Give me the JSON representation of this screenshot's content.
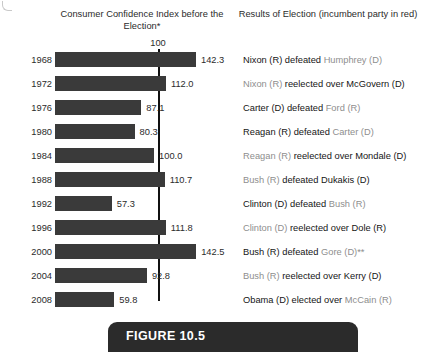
{
  "headers": {
    "left": "Consumer Confidence Index before the Election*",
    "right": "Results of Election (incumbent party in red)"
  },
  "axis": {
    "reference_label": "100"
  },
  "caption": {
    "label": "FIGURE 10.5"
  },
  "colors": {
    "bar": "#3a3a3a",
    "reference_line": "#111111",
    "incumbent_text": "#8e8e8e",
    "standard_text": "#151515",
    "banner": "#2b2b2b"
  },
  "chart_data": {
    "type": "bar",
    "title": "Consumer Confidence Index before the Election*",
    "xlabel": "",
    "ylabel": "",
    "orientation": "horizontal",
    "reference_value": 100,
    "xlim": [
      0,
      145
    ],
    "grid": false,
    "categories": [
      "1968",
      "1972",
      "1976",
      "1980",
      "1984",
      "1988",
      "1992",
      "1996",
      "2000",
      "2004",
      "2008"
    ],
    "values": [
      142.3,
      112.0,
      87.1,
      80.3,
      100.0,
      110.7,
      57.3,
      111.8,
      142.5,
      92.8,
      59.8
    ],
    "value_labels": [
      "142.3",
      "112.0",
      "87.1",
      "80.3",
      "100.0",
      "110.7",
      "57.3",
      "111.8",
      "142.5",
      "92.8",
      "59.8"
    ],
    "annotations": [
      {
        "year": "1968",
        "result_incumbent": "",
        "result_winner": "Nixon (R) defeated ",
        "result_loser": "Humphrey (D)",
        "incumbent_is_winner": false
      },
      {
        "year": "1972",
        "result_incumbent": "Nixon (R) ",
        "result_winner": "reelected over McGovern (D)",
        "result_loser": "",
        "incumbent_is_winner": true
      },
      {
        "year": "1976",
        "result_incumbent": "",
        "result_winner": "Carter (D) defeated ",
        "result_loser": "Ford (R)",
        "incumbent_is_winner": false
      },
      {
        "year": "1980",
        "result_incumbent": "",
        "result_winner": "Reagan (R) defeated ",
        "result_loser": "Carter (D)",
        "incumbent_is_winner": false
      },
      {
        "year": "1984",
        "result_incumbent": "Reagan (R) ",
        "result_winner": "reelected over Mondale (D)",
        "result_loser": "",
        "incumbent_is_winner": true
      },
      {
        "year": "1988",
        "result_incumbent": "Bush (R) ",
        "result_winner": "defeated Dukakis (D)",
        "result_loser": "",
        "incumbent_is_winner": true
      },
      {
        "year": "1992",
        "result_incumbent": "",
        "result_winner": "Clinton (D) defeated ",
        "result_loser": "Bush (R)",
        "incumbent_is_winner": false
      },
      {
        "year": "1996",
        "result_incumbent": "Clinton (D) ",
        "result_winner": "reelected over Dole (R)",
        "result_loser": "",
        "incumbent_is_winner": true
      },
      {
        "year": "2000",
        "result_incumbent": "",
        "result_winner": "Bush (R) defeated ",
        "result_loser": "Gore (D)**",
        "incumbent_is_winner": false
      },
      {
        "year": "2004",
        "result_incumbent": "Bush (R) ",
        "result_winner": "reelected over Kerry (D)",
        "result_loser": "",
        "incumbent_is_winner": true
      },
      {
        "year": "2008",
        "result_incumbent": "",
        "result_winner": "Obama (D) elected over ",
        "result_loser": "McCain (R)",
        "incumbent_is_winner": false
      }
    ]
  }
}
